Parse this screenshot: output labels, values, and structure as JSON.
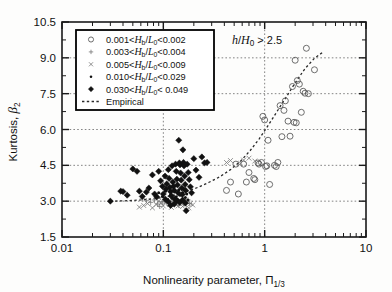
{
  "chart_data": {
    "type": "scatter",
    "title": "",
    "xlabel": "Nonlinearity parameter,  Π₁/₃",
    "ylabel": "Kurtosis,  β₂",
    "xscale": "log",
    "yscale": "linear",
    "xlim": [
      0.01,
      10
    ],
    "ylim": [
      1.5,
      10.5
    ],
    "xticks": [
      "0.01",
      "0.1",
      "1",
      "10"
    ],
    "xtick_values": [
      0.01,
      0.1,
      1,
      10
    ],
    "yticks": [
      "1.5",
      "3.0",
      "4.5",
      "6.0",
      "7.5",
      "9.0",
      "10.5"
    ],
    "ytick_values": [
      1.5,
      3.0,
      4.5,
      6.0,
      7.5,
      9.0,
      10.5
    ],
    "grid": true,
    "grid_style": "dotted",
    "grid_x_values": [
      0.1,
      1
    ],
    "grid_y_values": [
      3.0,
      4.5,
      6.0,
      7.5,
      9.0
    ],
    "annotation": "h/H₀ > 2.5",
    "legend_position": "top-left",
    "legend_entries": [
      {
        "marker": "open-circle",
        "label": "0.001<Hb/L₀<0.002"
      },
      {
        "marker": "plus",
        "label": "0.003<Hb/L₀<0.004"
      },
      {
        "marker": "cross",
        "label": "0.005<Hb/L₀<0.009"
      },
      {
        "marker": "small-dot",
        "label": "0.010<Hb/L₀<0.029"
      },
      {
        "marker": "diamond",
        "label": "0.030<Hb/L₀< 0.049"
      },
      {
        "marker": "dashed-line",
        "label": "Empirical"
      }
    ],
    "series": [
      {
        "name": "0.001<Hb/L0<0.002",
        "marker": "open-circle",
        "points": [
          [
            0.42,
            3.45
          ],
          [
            0.46,
            3.8
          ],
          [
            0.52,
            4.55
          ],
          [
            0.55,
            3.3
          ],
          [
            0.62,
            4.55
          ],
          [
            0.66,
            3.8
          ],
          [
            0.7,
            4.2
          ],
          [
            0.78,
            3.95
          ],
          [
            0.8,
            3.9
          ],
          [
            0.86,
            4.6
          ],
          [
            0.88,
            4.55
          ],
          [
            0.93,
            4.62
          ],
          [
            0.96,
            6.55
          ],
          [
            1.0,
            6.4
          ],
          [
            1.02,
            4.45
          ],
          [
            1.05,
            4.48
          ],
          [
            1.08,
            5.55
          ],
          [
            1.12,
            3.7
          ],
          [
            1.25,
            4.5
          ],
          [
            1.3,
            4.45
          ],
          [
            1.35,
            4.62
          ],
          [
            1.42,
            7.0
          ],
          [
            1.48,
            5.7
          ],
          [
            1.55,
            6.8
          ],
          [
            1.6,
            7.2
          ],
          [
            1.7,
            6.35
          ],
          [
            1.78,
            5.72
          ],
          [
            1.88,
            7.8
          ],
          [
            1.95,
            6.3
          ],
          [
            2.0,
            8.9
          ],
          [
            2.05,
            6.28
          ],
          [
            2.1,
            8.05
          ],
          [
            2.2,
            7.9
          ],
          [
            2.3,
            6.72
          ],
          [
            2.4,
            7.6
          ],
          [
            2.5,
            7.52
          ],
          [
            2.58,
            9.4
          ],
          [
            2.7,
            7.5
          ],
          [
            3.1,
            8.5
          ]
        ]
      },
      {
        "name": "0.003<Hb/L0<0.004",
        "marker": "plus",
        "points": [
          [
            0.062,
            3.1
          ],
          [
            0.068,
            3.02
          ],
          [
            0.075,
            2.95
          ],
          [
            0.082,
            3.05
          ],
          [
            0.088,
            2.88
          ],
          [
            0.092,
            2.78
          ],
          [
            0.098,
            2.98
          ],
          [
            0.102,
            3.0
          ],
          [
            0.108,
            2.92
          ],
          [
            0.112,
            3.02
          ],
          [
            0.118,
            2.85
          ],
          [
            0.122,
            2.95
          ],
          [
            0.128,
            3.05
          ],
          [
            0.132,
            2.9
          ],
          [
            0.138,
            3.0
          ],
          [
            0.142,
            2.82
          ],
          [
            0.148,
            2.95
          ],
          [
            0.152,
            3.02
          ],
          [
            0.16,
            2.88
          ],
          [
            0.168,
            2.96
          ],
          [
            0.175,
            3.05
          ],
          [
            0.182,
            2.9
          ]
        ]
      },
      {
        "name": "0.005<Hb/L0<0.009",
        "marker": "cross",
        "points": [
          [
            0.058,
            2.75
          ],
          [
            0.064,
            2.82
          ],
          [
            0.07,
            2.9
          ],
          [
            0.078,
            2.72
          ],
          [
            0.085,
            2.86
          ],
          [
            0.09,
            3.0
          ],
          [
            0.095,
            2.92
          ],
          [
            0.1,
            2.8
          ],
          [
            0.105,
            2.96
          ],
          [
            0.11,
            3.08
          ],
          [
            0.115,
            2.86
          ],
          [
            0.12,
            2.74
          ],
          [
            0.125,
            2.98
          ],
          [
            0.13,
            3.1
          ],
          [
            0.135,
            2.88
          ],
          [
            0.14,
            2.8
          ],
          [
            0.145,
            3.02
          ],
          [
            0.15,
            2.92
          ],
          [
            0.155,
            2.78
          ],
          [
            0.162,
            2.86
          ],
          [
            0.17,
            2.98
          ],
          [
            0.178,
            2.72
          ],
          [
            0.185,
            2.9
          ],
          [
            0.195,
            2.84
          ],
          [
            0.42,
            4.62
          ],
          [
            0.46,
            4.7
          ],
          [
            0.58,
            4.58
          ],
          [
            0.62,
            4.72
          ],
          [
            0.7,
            4.8
          ],
          [
            0.8,
            4.68
          ]
        ]
      },
      {
        "name": "0.010<Hb/L0<0.029",
        "marker": "small-dot",
        "points": [
          [
            0.09,
            3.35
          ],
          [
            0.098,
            3.2
          ],
          [
            0.105,
            3.42
          ],
          [
            0.11,
            3.05
          ],
          [
            0.115,
            3.55
          ],
          [
            0.118,
            3.28
          ],
          [
            0.122,
            3.12
          ],
          [
            0.126,
            3.62
          ],
          [
            0.13,
            3.4
          ],
          [
            0.134,
            3.18
          ],
          [
            0.138,
            3.08
          ],
          [
            0.142,
            3.48
          ],
          [
            0.146,
            3.25
          ],
          [
            0.15,
            3.0
          ],
          [
            0.155,
            3.35
          ],
          [
            0.16,
            3.52
          ],
          [
            0.165,
            3.15
          ],
          [
            0.17,
            3.3
          ],
          [
            0.175,
            3.05
          ]
        ]
      },
      {
        "name": "0.030<Hb/L0<0.049",
        "marker": "diamond",
        "points": [
          [
            0.03,
            3.0
          ],
          [
            0.038,
            3.42
          ],
          [
            0.04,
            3.4
          ],
          [
            0.044,
            3.25
          ],
          [
            0.05,
            4.35
          ],
          [
            0.055,
            4.25
          ],
          [
            0.058,
            3.42
          ],
          [
            0.062,
            3.2
          ],
          [
            0.068,
            3.38
          ],
          [
            0.072,
            3.55
          ],
          [
            0.078,
            4.1
          ],
          [
            0.082,
            3.3
          ],
          [
            0.086,
            3.18
          ],
          [
            0.09,
            4.25
          ],
          [
            0.094,
            3.85
          ],
          [
            0.098,
            3.62
          ],
          [
            0.1,
            3.3
          ],
          [
            0.104,
            4.05
          ],
          [
            0.106,
            3.5
          ],
          [
            0.108,
            3.72
          ],
          [
            0.112,
            4.32
          ],
          [
            0.114,
            3.95
          ],
          [
            0.116,
            3.58
          ],
          [
            0.118,
            3.4
          ],
          [
            0.12,
            3.22
          ],
          [
            0.122,
            4.48
          ],
          [
            0.124,
            3.8
          ],
          [
            0.126,
            3.62
          ],
          [
            0.128,
            3.45
          ],
          [
            0.13,
            3.1
          ],
          [
            0.132,
            4.55
          ],
          [
            0.134,
            4.25
          ],
          [
            0.136,
            3.92
          ],
          [
            0.138,
            3.68
          ],
          [
            0.14,
            3.35
          ],
          [
            0.142,
            5.55
          ],
          [
            0.144,
            4.6
          ],
          [
            0.146,
            4.52
          ],
          [
            0.148,
            4.18
          ],
          [
            0.15,
            3.88
          ],
          [
            0.152,
            3.55
          ],
          [
            0.154,
            3.28
          ],
          [
            0.156,
            5.15
          ],
          [
            0.158,
            4.62
          ],
          [
            0.16,
            4.48
          ],
          [
            0.162,
            4.05
          ],
          [
            0.164,
            3.7
          ],
          [
            0.166,
            3.45
          ],
          [
            0.168,
            2.6
          ],
          [
            0.172,
            4.55
          ],
          [
            0.176,
            4.2
          ],
          [
            0.18,
            3.9
          ],
          [
            0.185,
            3.6
          ],
          [
            0.19,
            3.35
          ],
          [
            0.2,
            4.78
          ],
          [
            0.21,
            4.3
          ],
          [
            0.225,
            4.0
          ],
          [
            0.24,
            4.85
          ],
          [
            0.255,
            4.6
          ],
          [
            0.27,
            4.62
          ],
          [
            0.135,
            3.02
          ],
          [
            0.145,
            2.95
          ],
          [
            0.128,
            2.88
          ],
          [
            0.155,
            3.05
          ],
          [
            0.165,
            2.92
          ],
          [
            0.112,
            2.98
          ],
          [
            0.105,
            3.08
          ],
          [
            0.118,
            2.82
          ]
        ]
      }
    ],
    "empirical_curve": {
      "name": "Empirical",
      "style": "dashed",
      "points": [
        [
          0.03,
          3.0
        ],
        [
          0.045,
          3.02
        ],
        [
          0.06,
          3.05
        ],
        [
          0.08,
          3.1
        ],
        [
          0.1,
          3.16
        ],
        [
          0.13,
          3.26
        ],
        [
          0.17,
          3.4
        ],
        [
          0.22,
          3.58
        ],
        [
          0.28,
          3.78
        ],
        [
          0.36,
          4.02
        ],
        [
          0.46,
          4.32
        ],
        [
          0.58,
          4.68
        ],
        [
          0.72,
          5.12
        ],
        [
          0.88,
          5.6
        ],
        [
          1.05,
          6.08
        ],
        [
          1.3,
          6.7
        ],
        [
          1.6,
          7.3
        ],
        [
          2.0,
          7.95
        ],
        [
          2.5,
          8.55
        ],
        [
          3.1,
          8.98
        ],
        [
          3.7,
          9.22
        ]
      ]
    }
  }
}
